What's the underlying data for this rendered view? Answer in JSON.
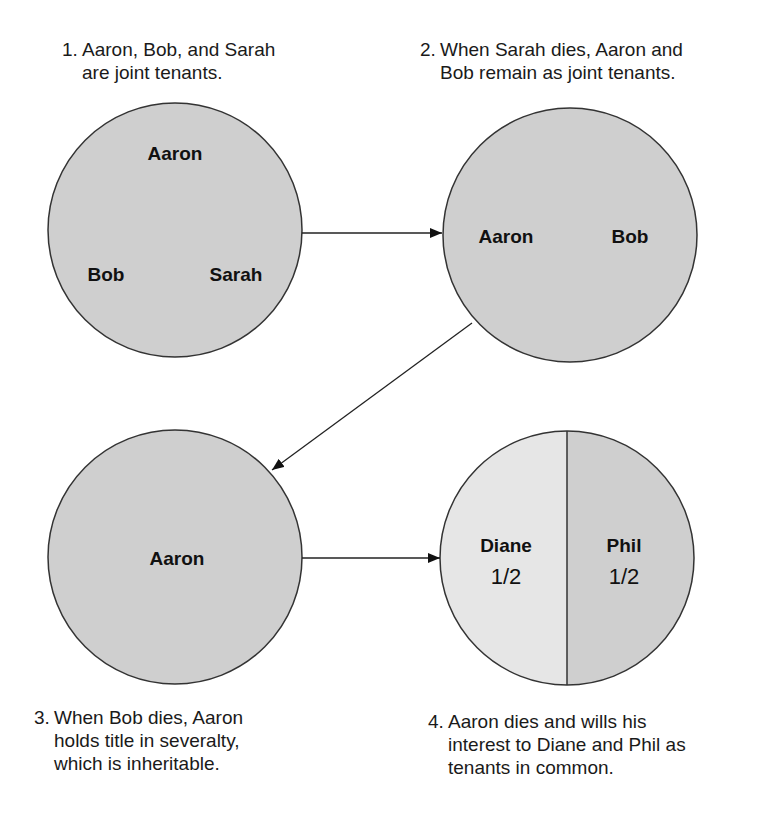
{
  "steps": [
    {
      "number": "1.",
      "caption_lines": [
        "Aaron, Bob, and Sarah",
        "are joint tenants."
      ],
      "circle": {
        "names": [
          "Aaron",
          "Bob",
          "Sarah"
        ],
        "fill": "#cfcfcf"
      }
    },
    {
      "number": "2.",
      "caption_lines": [
        "When Sarah dies, Aaron and",
        "Bob remain as joint tenants."
      ],
      "circle": {
        "names": [
          "Aaron",
          "Bob"
        ],
        "fill": "#cfcfcf"
      }
    },
    {
      "number": "3.",
      "caption_lines": [
        "When Bob dies, Aaron",
        "holds title in severalty,",
        "which is inheritable."
      ],
      "circle": {
        "names": [
          "Aaron"
        ],
        "fill": "#cfcfcf"
      }
    },
    {
      "number": "4.",
      "caption_lines": [
        "Aaron dies and wills his",
        "interest to Diane and Phil as",
        "tenants in common."
      ],
      "circle": {
        "halves": [
          {
            "name": "Diane",
            "share": "1/2",
            "share_num": "1",
            "share_den": "2",
            "fill": "#e6e6e6"
          },
          {
            "name": "Phil",
            "share": "1/2",
            "share_num": "1",
            "share_den": "2",
            "fill": "#cfcfcf"
          }
        ]
      }
    }
  ],
  "arrows": [
    {
      "from": "step-1",
      "to": "step-2"
    },
    {
      "from": "step-2",
      "to": "step-3"
    },
    {
      "from": "step-3",
      "to": "step-4"
    }
  ],
  "colors": {
    "stroke": "#333333",
    "shade_dark": "#cfcfcf",
    "shade_light": "#e6e6e6"
  }
}
